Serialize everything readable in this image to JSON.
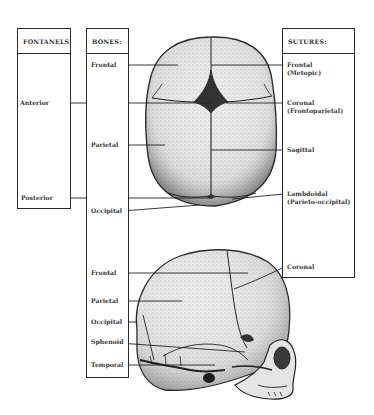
{
  "diagram": {
    "views": [
      "superior view",
      "lateral view"
    ]
  },
  "fontanels": {
    "title": "FONTANELS:",
    "items": [
      {
        "label": "Anterior"
      },
      {
        "label": "Posterior"
      }
    ]
  },
  "bones": {
    "title": "BONES:",
    "superior_items": [
      {
        "label": "Frontal"
      },
      {
        "label": "Parietal"
      },
      {
        "label": "Occipital"
      }
    ],
    "lateral_items": [
      {
        "label": "Frontal"
      },
      {
        "label": "Parietal"
      },
      {
        "label": "Occipital"
      },
      {
        "label": "Sphenoid"
      },
      {
        "label": "Temporal"
      }
    ]
  },
  "sutures": {
    "title": "SUTURES:",
    "items": [
      {
        "label": "Frontal",
        "sub": "(Metopic)"
      },
      {
        "label": "Coronal",
        "sub": "(Frontoparietal)"
      },
      {
        "label": "Sagittal",
        "sub": ""
      },
      {
        "label": "Lambdoidal",
        "sub": "(Parieto-occipital)"
      },
      {
        "label": "Coronal",
        "sub": ""
      }
    ]
  },
  "colors": {
    "line": "#2a2a2a",
    "bone_fill": "#e9e9e9",
    "bone_shade": "#bdbdbd",
    "fontanel_dark": "#333333"
  }
}
